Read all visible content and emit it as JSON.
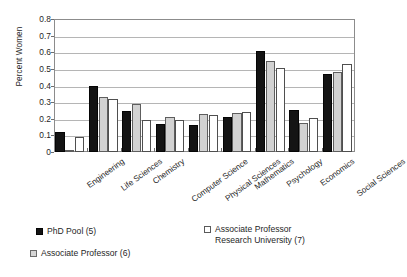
{
  "chart_data": {
    "type": "bar",
    "title": "",
    "xlabel": "",
    "ylabel": "Percent Women",
    "ylim": [
      0,
      0.8
    ],
    "ytick_labels": [
      "0.8",
      "0.7",
      "0.6",
      "0.5",
      "0.4",
      "0.3",
      "0.2",
      "0.1",
      "0"
    ],
    "ytick_values": [
      0.8,
      0.7,
      0.6,
      0.5,
      0.4,
      0.3,
      0.2,
      0.1,
      0
    ],
    "grid": true,
    "legend_position": "bottom",
    "categories": [
      "Engineering",
      "Life Sciences",
      "Chemistry",
      "Computer Science",
      "Physical Sciences",
      "Mathematics",
      "Psychology",
      "Economics",
      "Social Sciences"
    ],
    "series": [
      {
        "name": "PhD Pool (5)",
        "color": "#141414",
        "values": [
          0.12,
          0.4,
          0.248,
          0.17,
          0.165,
          0.208,
          0.605,
          0.253,
          0.468
        ]
      },
      {
        "name": "Associate Professor (6)",
        "color": "#d2d2d2",
        "values": [
          0.012,
          0.33,
          0.288,
          0.21,
          0.227,
          0.235,
          0.545,
          0.177,
          0.483
        ]
      },
      {
        "name": "Associate Professor Research University (7)",
        "color": "#ffffff",
        "values": [
          0.092,
          0.32,
          0.19,
          0.195,
          0.222,
          0.241,
          0.505,
          0.202,
          0.527
        ]
      }
    ]
  },
  "legend": {
    "entries": [
      {
        "label": "PhD Pool (5)",
        "line2": ""
      },
      {
        "label": "Associate Professor (6)",
        "line2": ""
      },
      {
        "label": "Associate Professor",
        "line2": "Research University (7)"
      }
    ]
  }
}
